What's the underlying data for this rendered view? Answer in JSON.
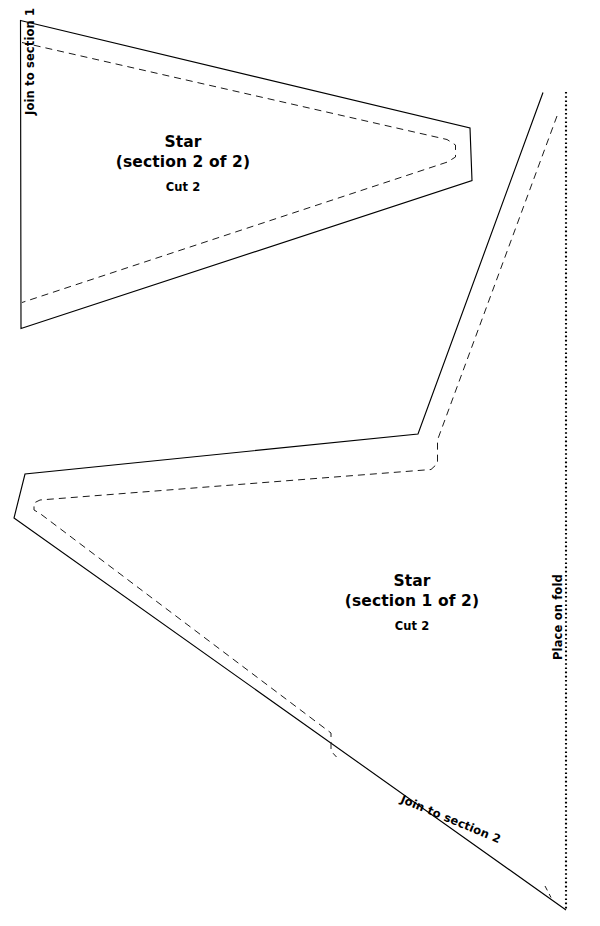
{
  "document": {
    "kind": "sewing-pattern-template",
    "background_color": "#ffffff",
    "line_color": "#000000",
    "width": 600,
    "height": 926
  },
  "pieces": [
    {
      "id": "section-2",
      "title": "Star",
      "section": "(section 2 of 2)",
      "cut": "Cut 2",
      "edge_label": "Join to section 1"
    },
    {
      "id": "section-1",
      "title": "Star",
      "section": "(section 1 of 2)",
      "cut": "Cut 2",
      "edge_label_fold": "Place on fold",
      "edge_label_join": "Join to section 2"
    }
  ],
  "geometry": {
    "section2_cut": "M 20.5 20.5 L 470 128 L 472 180.5 L 21 328.5 Z",
    "section2_seam": "M 22 42.5 L 447 139.5 L 455.5 145 L 455.5 157 L 447.5 162 L 22 302.5",
    "section1_cut": "M 543 92.5 L 418 434 L 25 474 L 14 518 L 566 910",
    "section1_seam": "M 557 116 L 437.5 440 L 437.5 463.5 L 431 469.5 L 40 500 L 34 503 L 34 510 L 40 513.5 L 331 733 L 331 751 L 336.5 757",
    "section1_seam_tail": "M 545 886 L 551 897.5",
    "fold_line": "M 566 92 L 566 910"
  }
}
